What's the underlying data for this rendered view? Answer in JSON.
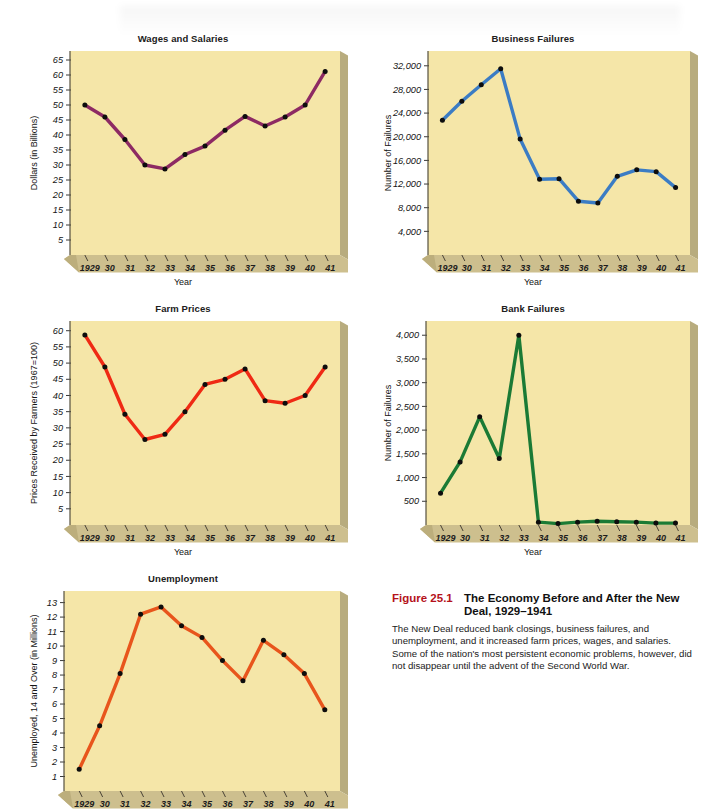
{
  "figure": {
    "number": "Figure 25.1",
    "title": "The Economy Before and After the New Deal, 1929–1941",
    "body": "The New Deal reduced bank closings, business failures, and unemployment, and it increased farm prices, wages, and salaries. Some of the nation's most persistent economic problems, however, did not disappear until the advent of the Second World War.",
    "number_color": "#b5121b"
  },
  "common": {
    "xlabel": "Year",
    "xticks": [
      "1929",
      "30",
      "31",
      "32",
      "33",
      "34",
      "35",
      "36",
      "37",
      "38",
      "39",
      "40",
      "41"
    ],
    "plot_bg": "#f5e6a8",
    "side_shadow": "#b8ac7e",
    "bottom_band": "#cdbf8e"
  },
  "chart_data": [
    {
      "id": "wages-and-salaries",
      "type": "line",
      "title": "Wages and Salaries",
      "xlabel": "Year",
      "ylabel": "Dollars (in Billions)",
      "color": "#8d2a63",
      "x": [
        "1929",
        "30",
        "31",
        "32",
        "33",
        "34",
        "35",
        "36",
        "37",
        "38",
        "39",
        "40",
        "41"
      ],
      "values": [
        50.0,
        46.0,
        38.5,
        30.0,
        28.7,
        33.5,
        36.3,
        41.6,
        46.2,
        43.0,
        46.0,
        50.0,
        61.2
      ],
      "yticks": [
        5,
        10,
        15,
        20,
        25,
        30,
        35,
        40,
        45,
        50,
        55,
        60,
        65
      ],
      "ylim": [
        0,
        68
      ],
      "grid": false,
      "legend": "none"
    },
    {
      "id": "business-failures",
      "type": "line",
      "title": "Business Failures",
      "xlabel": "Year",
      "ylabel": "Number of Failures",
      "color": "#3b7cc4",
      "x": [
        "1929",
        "30",
        "31",
        "32",
        "33",
        "34",
        "35",
        "36",
        "37",
        "38",
        "39",
        "40",
        "41"
      ],
      "values": [
        22800,
        26000,
        28800,
        31500,
        19600,
        12800,
        12900,
        9100,
        8800,
        13300,
        14400,
        14100,
        11400
      ],
      "yticks": [
        4000,
        8000,
        12000,
        16000,
        20000,
        24000,
        28000,
        32000
      ],
      "ytick_labels": [
        "4,000",
        "8,000",
        "12,000",
        "16,000",
        "20,000",
        "24,000",
        "28,000",
        "32,000"
      ],
      "ylim": [
        0,
        34500
      ],
      "grid": false,
      "legend": "none"
    },
    {
      "id": "farm-prices",
      "type": "line",
      "title": "Farm Prices",
      "xlabel": "Year",
      "ylabel": "Prices Received by Farmers (1967=100)",
      "color": "#ef2a14",
      "x": [
        "1929",
        "30",
        "31",
        "32",
        "33",
        "34",
        "35",
        "36",
        "37",
        "38",
        "39",
        "40",
        "41"
      ],
      "values": [
        58.7,
        48.8,
        34.2,
        26.4,
        28.0,
        35.0,
        43.4,
        45.0,
        48.2,
        38.4,
        37.6,
        40.0,
        48.8
      ],
      "yticks": [
        5,
        10,
        15,
        20,
        25,
        30,
        35,
        40,
        45,
        50,
        55,
        60
      ],
      "ylim": [
        0,
        63
      ],
      "grid": false,
      "legend": "none"
    },
    {
      "id": "bank-failures",
      "type": "line",
      "title": "Bank Failures",
      "xlabel": "Year",
      "ylabel": "Number of Failures",
      "color": "#1b7a35",
      "x": [
        "1929",
        "30",
        "31",
        "32",
        "33",
        "34",
        "35",
        "36",
        "37",
        "38",
        "39",
        "40",
        "41"
      ],
      "values": [
        670,
        1330,
        2280,
        1400,
        4000,
        60,
        30,
        60,
        80,
        70,
        60,
        40,
        40
      ],
      "yticks": [
        500,
        1000,
        1500,
        2000,
        2500,
        3000,
        3500,
        4000
      ],
      "ytick_labels": [
        "500",
        "1,000",
        "1,500",
        "2,000",
        "2,500",
        "3,000",
        "3,500",
        "4,000"
      ],
      "ylim": [
        0,
        4300
      ],
      "grid": false,
      "legend": "none"
    },
    {
      "id": "unemployment",
      "type": "line",
      "title": "Unemployment",
      "xlabel": "Year",
      "ylabel": "Unemployed, 14 and Over (in Millions)",
      "color": "#e8551c",
      "x": [
        "1929",
        "30",
        "31",
        "32",
        "33",
        "34",
        "35",
        "36",
        "37",
        "38",
        "39",
        "40",
        "41"
      ],
      "values": [
        1.5,
        4.5,
        8.1,
        12.2,
        12.7,
        11.4,
        10.6,
        9.0,
        7.6,
        10.4,
        9.4,
        8.1,
        5.6
      ],
      "yticks": [
        1,
        2,
        3,
        4,
        5,
        6,
        7,
        8,
        9,
        10,
        11,
        12,
        13
      ],
      "ylim": [
        0,
        13.8
      ],
      "grid": false,
      "legend": "none"
    }
  ]
}
